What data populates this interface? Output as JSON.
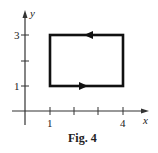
{
  "figure": {
    "caption": "Fig. 4",
    "x_axis_label": "x",
    "y_axis_label": "y",
    "x_tick_labels": [
      {
        "value": 1,
        "label": "1"
      },
      {
        "value": 4,
        "label": "4"
      }
    ],
    "x_ticks": [
      1,
      2,
      3,
      4
    ],
    "y_tick_labels": [
      {
        "value": 1,
        "label": "1"
      },
      {
        "value": 3,
        "label": "3"
      }
    ],
    "y_ticks": [
      1,
      2,
      3
    ],
    "path": {
      "shape": "rectangle",
      "vertices": [
        [
          1,
          1
        ],
        [
          4,
          1
        ],
        [
          4,
          3
        ],
        [
          1,
          3
        ]
      ],
      "direction": "counterclockwise",
      "arrows": [
        {
          "edge": "bottom",
          "direction": "right"
        },
        {
          "edge": "top",
          "direction": "left"
        }
      ]
    },
    "colors": {
      "path": "#111111",
      "axes": "#333333"
    }
  }
}
